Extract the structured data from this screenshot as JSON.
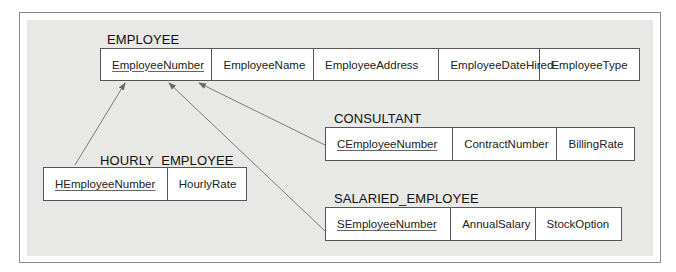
{
  "relations": {
    "employee": {
      "name": "EMPLOYEE",
      "attributes": [
        {
          "name": "EmployeeNumber",
          "primary_key": true
        },
        {
          "name": "EmployeeName",
          "primary_key": false
        },
        {
          "name": "EmployeeAddress",
          "primary_key": false
        },
        {
          "name": "EmployeeDateHired",
          "primary_key": false
        },
        {
          "name": "EmployeeType",
          "primary_key": false
        }
      ]
    },
    "consultant": {
      "name": "CONSULTANT",
      "attributes": [
        {
          "name": "CEmployeeNumber",
          "primary_key": true
        },
        {
          "name": "ContractNumber",
          "primary_key": false
        },
        {
          "name": "BillingRate",
          "primary_key": false
        }
      ]
    },
    "hourly_employee": {
      "name": "HOURLY_EMPLOYEE",
      "attributes": [
        {
          "name": "HEmployeeNumber",
          "primary_key": true
        },
        {
          "name": "HourlyRate",
          "primary_key": false
        }
      ]
    },
    "salaried_employee": {
      "name": "SALARIED_EMPLOYEE",
      "attributes": [
        {
          "name": "SEmployeeNumber",
          "primary_key": true
        },
        {
          "name": "AnnualSalary",
          "primary_key": false
        },
        {
          "name": "StockOption",
          "primary_key": false
        }
      ]
    }
  },
  "references": [
    {
      "from": "HOURLY_EMPLOYEE.HEmployeeNumber",
      "to": "EMPLOYEE.EmployeeNumber"
    },
    {
      "from": "SALARIED_EMPLOYEE.SEmployeeNumber",
      "to": "EMPLOYEE.EmployeeNumber"
    },
    {
      "from": "CONSULTANT.CEmployeeNumber",
      "to": "EMPLOYEE.EmployeeNumber"
    }
  ],
  "colors": {
    "panel": "#e8e8e6",
    "border": "#555555",
    "arrow": "#777777"
  }
}
